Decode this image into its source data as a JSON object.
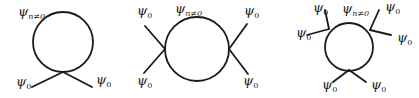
{
  "diagrams": [
    {
      "id": "tadpole-two-leg",
      "loop_label": {
        "symbol": "ψ",
        "subscript": "n≠0"
      },
      "leg_labels": [
        {
          "symbol": "ψ",
          "subscript": "0"
        },
        {
          "symbol": "ψ",
          "subscript": "0"
        }
      ]
    },
    {
      "id": "bubble-four-leg",
      "loop_label": {
        "symbol": "ψ",
        "subscript": "n≠0"
      },
      "leg_labels": [
        {
          "symbol": "ψ",
          "subscript": "0"
        },
        {
          "symbol": "ψ",
          "subscript": "0"
        },
        {
          "symbol": "ψ",
          "subscript": "0"
        },
        {
          "symbol": "ψ",
          "subscript": "0"
        }
      ]
    },
    {
      "id": "triangle-six-leg",
      "loop_label": {
        "symbol": "ψ",
        "subscript": "n≠0"
      },
      "leg_labels": [
        {
          "symbol": "ψ",
          "subscript": "0"
        },
        {
          "symbol": "ψ",
          "subscript": "0"
        },
        {
          "symbol": "ψ",
          "subscript": "0"
        },
        {
          "symbol": "ψ",
          "subscript": "0"
        },
        {
          "symbol": "ψ",
          "subscript": "0"
        },
        {
          "symbol": "ψ",
          "subscript": "0"
        }
      ]
    }
  ]
}
